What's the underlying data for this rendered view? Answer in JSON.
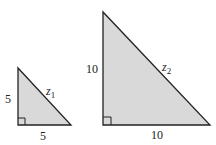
{
  "diagram": {
    "fill_color": "#d9d9d9",
    "stroke_color": "#222222",
    "triangles": [
      {
        "name": "small",
        "vertical_leg": "5",
        "horizontal_leg": "5",
        "hypotenuse_label": "z",
        "hypotenuse_sub": "1",
        "right_angle_marker": true
      },
      {
        "name": "large",
        "vertical_leg": "10",
        "horizontal_leg": "10",
        "hypotenuse_label": "z",
        "hypotenuse_sub": "2",
        "right_angle_marker": true
      }
    ]
  }
}
